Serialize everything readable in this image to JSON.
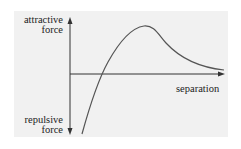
{
  "diagram": {
    "type": "force-vs-separation curve",
    "labels": {
      "y_positive_line1": "attractive",
      "y_positive_line2": "force",
      "y_negative_line1": "repulsive",
      "y_negative_line2": "force",
      "x_axis": "separation"
    },
    "colors": {
      "panel_background": "#f1f1f1",
      "axis": "#333333",
      "curve": "#555555",
      "text": "#222222"
    },
    "curve_description": "Starts strongly repulsive near small separation, crosses zero, peaks in attractive region, then decays toward zero at large separation"
  }
}
